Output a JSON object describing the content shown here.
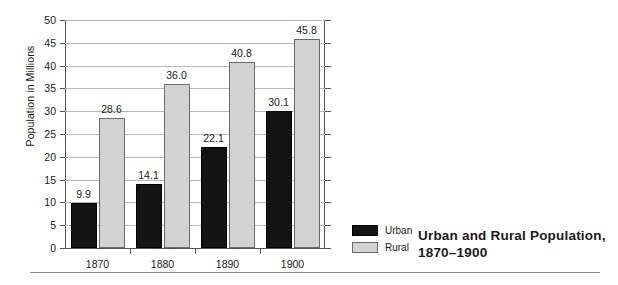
{
  "chart_data": {
    "type": "bar",
    "title": "Urban and Rural Population, 1870–1900",
    "title_line1": "Urban and Rural Population,",
    "title_line2": "1870–1900",
    "xlabel": "",
    "ylabel": "Population in Millions",
    "ylim": [
      0,
      50
    ],
    "ytick_step": 5,
    "yticks": [
      "0",
      "5",
      "10",
      "15",
      "20",
      "25",
      "30",
      "35",
      "40",
      "45",
      "50"
    ],
    "grid": true,
    "legend_position": "bottom-right-outside",
    "categories": [
      "1870",
      "1880",
      "1890",
      "1900"
    ],
    "series": [
      {
        "name": "Urban",
        "color": "#141414",
        "values": [
          9.9,
          14.1,
          22.1,
          30.1
        ],
        "labels": [
          "9.9",
          "14.1",
          "22.1",
          "30.1"
        ]
      },
      {
        "name": "Rural",
        "color": "#d2d2d2",
        "values": [
          28.6,
          36.0,
          40.8,
          45.8
        ],
        "labels": [
          "28.6",
          "36.0",
          "40.8",
          "45.8"
        ]
      }
    ]
  },
  "legend": {
    "items": [
      {
        "label": "Urban",
        "swatch": "urban"
      },
      {
        "label": "Rural",
        "swatch": "rural"
      }
    ]
  },
  "colors": {
    "urban": "#141414",
    "rural": "#d2d2d2",
    "gridline": "#b9b9b9",
    "axis": "#555555",
    "text": "#1a1a1a",
    "background": "#ffffff"
  }
}
